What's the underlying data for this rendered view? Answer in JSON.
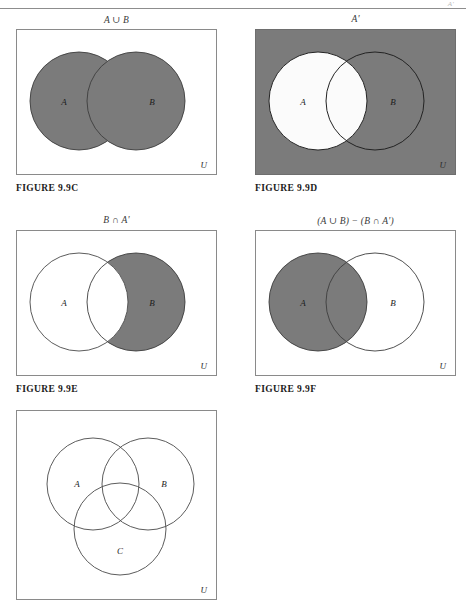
{
  "page": {
    "header_fragment": "A'",
    "rule_color": "#8d8d8d",
    "shade_color": "#7b7b7b",
    "outline_color": "#8a8a8a",
    "universe_label": "U"
  },
  "figures": [
    {
      "id": "fig-99c",
      "title": "A ∪ B",
      "caption": "FIGURE  9.9C",
      "box_filled": false,
      "universe_label": "U",
      "circles": [
        {
          "label": "A",
          "shaded": true
        },
        {
          "label": "B",
          "shaded": true
        }
      ],
      "description": "Union of A and B shaded"
    },
    {
      "id": "fig-99d",
      "title": "A'",
      "caption": "FIGURE  9.9D",
      "box_filled": true,
      "universe_label": "U",
      "circles": [
        {
          "label": "A",
          "shaded": false
        },
        {
          "label": "B",
          "shaded": false
        }
      ],
      "description": "Complement of A shaded: everything outside circle A"
    },
    {
      "id": "fig-99e",
      "title": "B ∩ A'",
      "caption": "FIGURE  9.9E",
      "box_filled": false,
      "universe_label": "U",
      "circles": [
        {
          "label": "A",
          "shaded": false
        },
        {
          "label": "B",
          "shaded": true
        }
      ],
      "description": "Part of B outside A shaded"
    },
    {
      "id": "fig-99f",
      "title": "(A ∪ B) − (B ∩ A')",
      "caption": "FIGURE  9.9F",
      "box_filled": false,
      "universe_label": "U",
      "circles": [
        {
          "label": "A",
          "shaded": true
        },
        {
          "label": "B",
          "shaded": false
        }
      ],
      "description": "Circle A shaded entirely"
    },
    {
      "id": "fig-99g",
      "title": "",
      "caption": "",
      "box_filled": false,
      "universe_label": "U",
      "circles": [
        {
          "label": "A",
          "shaded": false
        },
        {
          "label": "B",
          "shaded": false
        },
        {
          "label": "C",
          "shaded": false
        }
      ],
      "description": "Three overlapping circles A, B, C, none shaded"
    }
  ]
}
